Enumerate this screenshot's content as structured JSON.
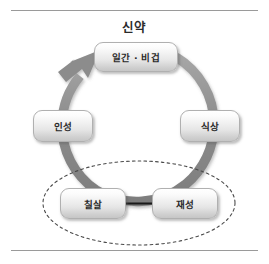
{
  "figure": {
    "title": "신약",
    "frame": {
      "top_rule": true,
      "bottom_rule": true,
      "rule_color": "#9a9a9a"
    },
    "background_color": "#ffffff",
    "ring": {
      "description": "circular-flow-arrow",
      "color": "#8e8e8e",
      "direction": "clockwise-into-top-node",
      "arrowhead": "points-up-right-to-top-node"
    },
    "highlight_ellipse": {
      "style": "dashed",
      "color": "#4a4a4a",
      "encloses": [
        "칠살",
        "재성"
      ]
    },
    "nodes": [
      {
        "id": "top",
        "label": "일간 · 비겁"
      },
      {
        "id": "right",
        "label": "식상"
      },
      {
        "id": "left",
        "label": "인성"
      },
      {
        "id": "bl",
        "label": "칠살"
      },
      {
        "id": "br",
        "label": "재성"
      }
    ],
    "straight_arrow": {
      "from": "재성",
      "to": "칠살",
      "color": "#1a1a1a",
      "direction": "right-to-left"
    }
  }
}
